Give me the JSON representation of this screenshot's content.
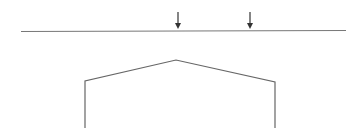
{
  "diagram": {
    "background": "#ffffff",
    "stroke_color": "#555555",
    "beam": {
      "x1": 21,
      "y1": 31.5,
      "x2": 346,
      "y2": 30.5
    },
    "loads": [
      {
        "x": 178,
        "y_top": 12,
        "y_tip": 29
      },
      {
        "x": 250,
        "y_top": 12,
        "y_tip": 29
      }
    ],
    "frame": {
      "points": [
        [
          85,
          128
        ],
        [
          85,
          81
        ],
        [
          176,
          60
        ],
        [
          275,
          82
        ],
        [
          275,
          128
        ]
      ]
    }
  }
}
